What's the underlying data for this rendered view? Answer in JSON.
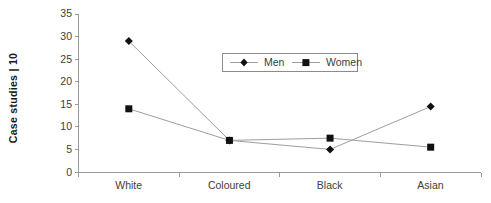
{
  "chart_data": {
    "type": "line",
    "title": "",
    "subtitle": "",
    "xlabel": "",
    "ylabel": "Case studies | 10",
    "categories": [
      "White",
      "Coloured",
      "Black",
      "Asian"
    ],
    "series": [
      {
        "name": "Men",
        "marker": "diamond",
        "color": "#111111",
        "values": [
          29,
          7,
          5,
          14.5
        ]
      },
      {
        "name": "Women",
        "marker": "square",
        "color": "#111111",
        "values": [
          14,
          7,
          7.5,
          5.5
        ]
      }
    ],
    "ylim": [
      0,
      35
    ],
    "ytick_step": 5,
    "ytick_labels": [
      "0",
      "5",
      "10",
      "15",
      "20",
      "25",
      "30",
      "35"
    ],
    "grid": false,
    "legend_position": "upper-center",
    "axis_color": "#9a9a9a",
    "line_color": "#9e9e9e",
    "background": "#ffffff"
  },
  "legend": {
    "entries": [
      {
        "label": "Men",
        "marker": "diamond-icon"
      },
      {
        "label": "Women",
        "marker": "square-icon"
      }
    ]
  }
}
